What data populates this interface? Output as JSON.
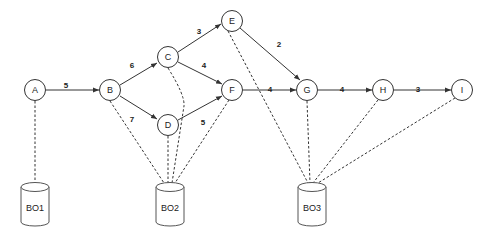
{
  "nodes": {
    "A": {
      "label": "A"
    },
    "B": {
      "label": "B"
    },
    "C": {
      "label": "C"
    },
    "D": {
      "label": "D"
    },
    "E": {
      "label": "E"
    },
    "F": {
      "label": "F"
    },
    "G": {
      "label": "G"
    },
    "H": {
      "label": "H"
    },
    "I": {
      "label": "I"
    }
  },
  "edges": {
    "AB": "5",
    "BC": "6",
    "BD": "7",
    "CE": "3",
    "CF": "4",
    "DF": "5",
    "EG": "2",
    "FG": "4",
    "GH": "4",
    "HI": "3"
  },
  "stores": {
    "BO1": "BO1",
    "BO2": "BO2",
    "BO3": "BO3"
  },
  "colors": {
    "stroke": "#333333",
    "background": "#ffffff"
  }
}
